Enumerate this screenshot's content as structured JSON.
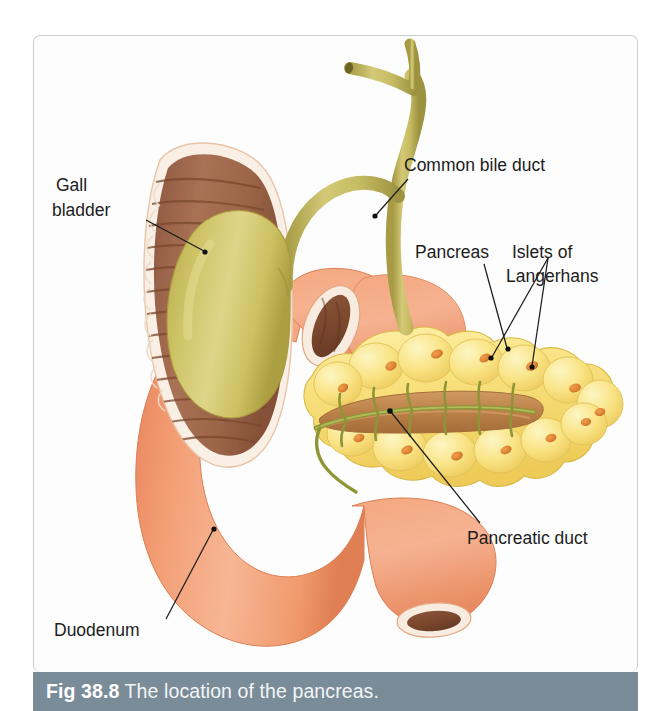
{
  "figure": {
    "caption_number": "Fig 38.8",
    "caption_title": " The location of the pancreas.",
    "caption_bar_color": "#7b8c99",
    "caption_text_color": "#ffffff",
    "panel_border_color": "#c9ced2",
    "background_color": "#ffffff"
  },
  "labels": {
    "gall_bladder": {
      "line1": "Gall",
      "line2": "bladder"
    },
    "common_bile_duct": {
      "line1": "Common bile duct"
    },
    "pancreas": {
      "line1": "Pancreas"
    },
    "islets": {
      "line1": "Islets of",
      "line2": "Langerhans"
    },
    "pancreatic_duct": {
      "line1": "Pancreatic duct"
    },
    "duodenum": {
      "line1": "Duodenum"
    }
  },
  "anatomy": {
    "gall_bladder_color": "#c6bb5c",
    "bile_duct_color": "#bdb257",
    "duodenum_wall_color": "#f0996e",
    "duodenum_mucosa_color": "#9c6347",
    "duodenum_rim_color": "#f7ece2",
    "pancreas_color": "#f7e07a",
    "pancreas_lobule_highlight": "#fdf3b8",
    "islet_color": "#e08b3a",
    "pancreatic_duct_color": "#9aa03c",
    "pancreatic_duct_channel_color": "#c2894f",
    "label_text_color": "#1c1c1c",
    "leader_line_color": "#1c1c1c"
  }
}
